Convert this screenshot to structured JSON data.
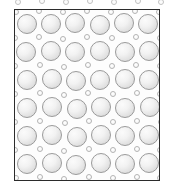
{
  "figure": {
    "kind": "schematic-micrograph",
    "title": "",
    "caption": "",
    "canvas": {
      "width": 174,
      "height": 191
    },
    "background_color": "#ffffff"
  },
  "frame": {
    "x": 14,
    "y": 9,
    "width": 146,
    "height": 172,
    "border_color": "#2b2b2b",
    "border_width": 1.4,
    "fill_color": "#fdfdfd"
  },
  "lattice": {
    "description": "close-packed array of large shaded spheres with small interstitial rings",
    "large_particle": {
      "diameter": 20,
      "outline_color": "#9a9a9a",
      "highlight_color": "#fbfbfb",
      "shadow_color": "#cfcfcf",
      "rows": 6,
      "columns": 6
    },
    "small_particle": {
      "diameter": 6,
      "outline_color": "#b4b4b4",
      "fill_color": "#fcfcfc"
    },
    "row_spacing": 28,
    "column_spacing": 24.5,
    "row_offset_alternating": 2
  },
  "chart_data": {
    "type": "scatter",
    "title": "",
    "xlabel": "",
    "ylabel": "",
    "xlim": [
      0,
      146
    ],
    "ylim": [
      0,
      172
    ],
    "grid": false,
    "legend": null,
    "series": [
      {
        "name": "large-spheres",
        "marker": "filled-circle-shaded",
        "size": 20,
        "points": [
          [
            12,
            14
          ],
          [
            36,
            14
          ],
          [
            60,
            13
          ],
          [
            85,
            15
          ],
          [
            109,
            13
          ],
          [
            133,
            14
          ],
          [
            11,
            42
          ],
          [
            36,
            41
          ],
          [
            60,
            42
          ],
          [
            85,
            41
          ],
          [
            110,
            42
          ],
          [
            134,
            41
          ],
          [
            12,
            70
          ],
          [
            37,
            69
          ],
          [
            61,
            71
          ],
          [
            85,
            70
          ],
          [
            110,
            69
          ],
          [
            134,
            70
          ],
          [
            12,
            98
          ],
          [
            37,
            97
          ],
          [
            62,
            99
          ],
          [
            86,
            97
          ],
          [
            110,
            98
          ],
          [
            135,
            97
          ],
          [
            12,
            126
          ],
          [
            37,
            125
          ],
          [
            62,
            127
          ],
          [
            86,
            125
          ],
          [
            110,
            126
          ],
          [
            134,
            125
          ],
          [
            12,
            154
          ],
          [
            37,
            153
          ],
          [
            61,
            155
          ],
          [
            86,
            153
          ],
          [
            110,
            154
          ],
          [
            134,
            153
          ]
        ]
      },
      {
        "name": "small-rings",
        "marker": "open-circle",
        "size": 6,
        "points": [
          [
            1,
            2
          ],
          [
            24,
            1
          ],
          [
            48,
            2
          ],
          [
            72,
            1
          ],
          [
            96,
            2
          ],
          [
            120,
            1
          ],
          [
            144,
            2
          ],
          [
            0,
            28
          ],
          [
            24,
            27
          ],
          [
            48,
            29
          ],
          [
            72,
            27
          ],
          [
            97,
            28
          ],
          [
            121,
            27
          ],
          [
            145,
            28
          ],
          [
            0,
            56
          ],
          [
            25,
            55
          ],
          [
            49,
            57
          ],
          [
            73,
            55
          ],
          [
            97,
            56
          ],
          [
            121,
            55
          ],
          [
            145,
            56
          ],
          [
            0,
            84
          ],
          [
            25,
            83
          ],
          [
            49,
            85
          ],
          [
            73,
            83
          ],
          [
            98,
            84
          ],
          [
            122,
            83
          ],
          [
            145,
            84
          ],
          [
            0,
            112
          ],
          [
            25,
            111
          ],
          [
            50,
            113
          ],
          [
            74,
            111
          ],
          [
            98,
            112
          ],
          [
            122,
            111
          ],
          [
            146,
            112
          ],
          [
            0,
            140
          ],
          [
            25,
            139
          ],
          [
            49,
            141
          ],
          [
            74,
            139
          ],
          [
            98,
            140
          ],
          [
            122,
            139
          ],
          [
            145,
            140
          ],
          [
            1,
            168
          ],
          [
            25,
            167
          ],
          [
            49,
            169
          ],
          [
            74,
            167
          ],
          [
            98,
            168
          ],
          [
            122,
            167
          ],
          [
            145,
            168
          ]
        ]
      }
    ]
  },
  "top_fringe": {
    "description": "partially cropped row of small rings above the frame",
    "rings": [
      [
        18,
        2
      ],
      [
        42,
        1
      ],
      [
        66,
        2
      ],
      [
        90,
        1
      ],
      [
        114,
        2
      ],
      [
        138,
        1
      ],
      [
        161,
        2
      ]
    ],
    "ring_diameter": 6,
    "outline_color": "#c2c2c2"
  }
}
